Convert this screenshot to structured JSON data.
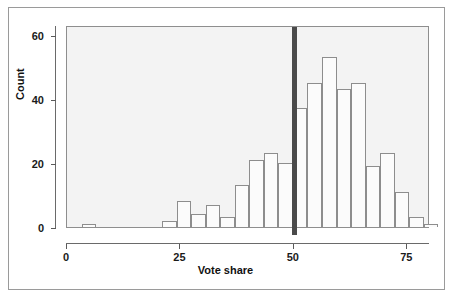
{
  "chart_data": {
    "type": "bar",
    "title": "",
    "subtitle": "",
    "xlabel": "Vote share",
    "ylabel": "Count",
    "xlim": [
      0,
      80
    ],
    "ylim": [
      0,
      63
    ],
    "grid": false,
    "legend": null,
    "bin_width": 3.2,
    "x_ticks": [
      0,
      25,
      50,
      75
    ],
    "x_tick_labels": [
      "0",
      "25",
      "50",
      "75"
    ],
    "y_ticks": [
      0,
      20,
      40,
      60
    ],
    "y_tick_labels": [
      "0",
      "20",
      "40",
      "60"
    ],
    "bin_starts": [
      3.3,
      21.0,
      24.2,
      27.4,
      30.6,
      33.8,
      37.0,
      40.2,
      43.4,
      46.6,
      49.8,
      53.0,
      56.2,
      59.4,
      62.6,
      65.8,
      69.0,
      72.2,
      75.4
    ],
    "categories": [
      "3-6",
      "21-24",
      "24-27",
      "27-31",
      "31-34",
      "34-37",
      "37-40",
      "40-43",
      "43-47",
      "47-50",
      "50-53",
      "53-56",
      "56-59",
      "59-63",
      "63-66",
      "66-69",
      "69-72",
      "72-75",
      "75-79"
    ],
    "values": [
      1,
      2,
      8,
      4,
      7,
      3,
      13,
      21,
      23,
      20,
      37,
      45,
      53,
      43,
      45,
      19,
      23,
      11,
      3
    ],
    "tail_value": 1,
    "annotations": [
      {
        "name": "fifty-percent-threshold-line",
        "type": "vertical-line",
        "x": 50,
        "color": "#4a4a4a"
      }
    ],
    "colors": {
      "bar_fill": "#fbfbfb",
      "bar_edge": "#8d8d8d",
      "plot_background": "#f3f3f3",
      "axis": "#5a5a5a",
      "text": "#111111",
      "threshold_line": "#4a4a4a"
    }
  }
}
